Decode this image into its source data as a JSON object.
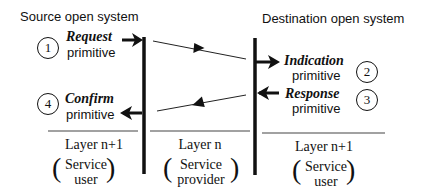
{
  "diagram": {
    "source": {
      "title": "Source open system",
      "request": {
        "number": "1",
        "name": "Request",
        "word": "primitive"
      },
      "confirm": {
        "number": "4",
        "name": "Confirm",
        "word": "primitive"
      },
      "layer": "Layer n+1",
      "role_line1": "Service",
      "role_line2": "user"
    },
    "provider": {
      "layer": "Layer n",
      "role_line1": "Service",
      "role_line2": "provider"
    },
    "destination": {
      "title": "Destination open system",
      "indication": {
        "number": "2",
        "name": "Indication",
        "word": "primitive"
      },
      "response": {
        "number": "3",
        "name": "Response",
        "word": "primitive"
      },
      "layer": "Layer n+1",
      "role_line1": "Service",
      "role_line2": "user"
    },
    "paren_open": "(",
    "paren_close": ")",
    "colors": {
      "ink": "#111111",
      "background": "#ffffff"
    }
  }
}
